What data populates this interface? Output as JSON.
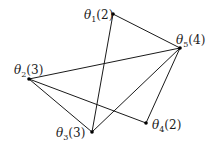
{
  "diagram": {
    "type": "graph",
    "nodes": [
      {
        "id": "t1",
        "symbol": "θ",
        "sub": "1",
        "weight": "(2)",
        "x": 113,
        "y": 14,
        "lx": 84,
        "ly": 19
      },
      {
        "id": "t2",
        "symbol": "θ",
        "sub": "2",
        "weight": "(3)",
        "x": 29,
        "y": 79,
        "lx": 14,
        "ly": 74
      },
      {
        "id": "t3",
        "symbol": "θ",
        "sub": "3",
        "weight": "(3)",
        "x": 92,
        "y": 132,
        "lx": 56,
        "ly": 137
      },
      {
        "id": "t4",
        "symbol": "θ",
        "sub": "4",
        "weight": "(2)",
        "x": 146,
        "y": 123,
        "lx": 152,
        "ly": 129
      },
      {
        "id": "t5",
        "symbol": "θ",
        "sub": "5",
        "weight": "(4)",
        "x": 180,
        "y": 48,
        "lx": 176,
        "ly": 44
      }
    ],
    "edges": [
      {
        "from": "t1",
        "to": "t5"
      },
      {
        "from": "t1",
        "to": "t3"
      },
      {
        "from": "t2",
        "to": "t5"
      },
      {
        "from": "t2",
        "to": "t3"
      },
      {
        "from": "t2",
        "to": "t4"
      },
      {
        "from": "t3",
        "to": "t5"
      },
      {
        "from": "t4",
        "to": "t5"
      }
    ],
    "colors": {
      "line": "#1a1a1a",
      "node": "#000000",
      "background": "#ffffff"
    }
  }
}
